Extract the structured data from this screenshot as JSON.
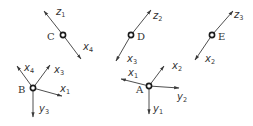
{
  "diagram": {
    "type": "coordinate-frames",
    "colors": {
      "line": "#3a3a3a",
      "text": "#333333",
      "node": "#1a1a1a",
      "background": "#ffffff"
    },
    "nodes": [
      {
        "id": "C",
        "label": "C",
        "x": 63,
        "y": 35
      },
      {
        "id": "B",
        "label": "B",
        "x": 33,
        "y": 88
      },
      {
        "id": "D",
        "label": "D",
        "x": 131,
        "y": 35
      },
      {
        "id": "A",
        "label": "A",
        "x": 149,
        "y": 86
      },
      {
        "id": "E",
        "label": "E",
        "x": 212,
        "y": 35
      }
    ],
    "axes": {
      "C_z1": {
        "base": "z",
        "sub": "1"
      },
      "C_x4": {
        "base": "x",
        "sub": "4"
      },
      "B_x4": {
        "base": "x",
        "sub": "4"
      },
      "B_x3": {
        "base": "x",
        "sub": "3"
      },
      "B_x1": {
        "base": "x",
        "sub": "1"
      },
      "B_y3": {
        "base": "y",
        "sub": "3"
      },
      "D_z2": {
        "base": "z",
        "sub": "2"
      },
      "D_x3": {
        "base": "x",
        "sub": "3"
      },
      "A_x1": {
        "base": "x",
        "sub": "1"
      },
      "A_x2": {
        "base": "x",
        "sub": "2"
      },
      "A_y2": {
        "base": "y",
        "sub": "2"
      },
      "A_y1": {
        "base": "y",
        "sub": "1"
      },
      "E_z3": {
        "base": "z",
        "sub": "3"
      },
      "E_x2": {
        "base": "x",
        "sub": "2"
      }
    }
  }
}
